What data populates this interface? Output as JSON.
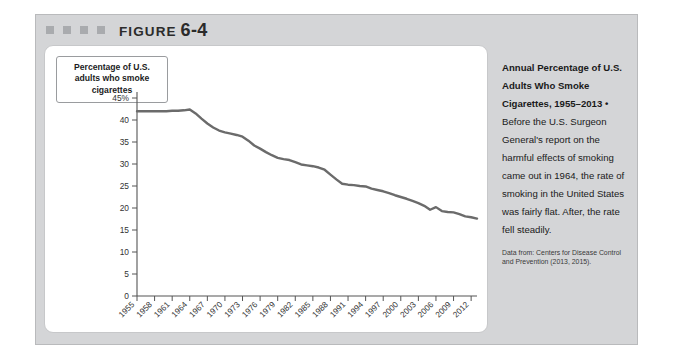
{
  "figure": {
    "label_word": "FIGURE",
    "label_number": "6-4",
    "decor_square_count": 4,
    "frame_color": "#d4d5d7",
    "panel_color": "#ffffff"
  },
  "axis_title_box": {
    "text": "Percentage of U.S. adults who smoke cigarettes"
  },
  "caption": {
    "lead": "Annual Percentage of U.S. Adults Who Smoke Cigarettes, 1955–2013 •",
    "body": "Before the U.S. Surgeon General's report on the harmful effects of smoking came out in 1964, the rate of smoking in the United States was fairly flat. After, the rate fell steadily.",
    "source": "Data from: Centers for Disease Control and Prevention (2013, 2015)."
  },
  "chart_data": {
    "type": "line",
    "title": "",
    "xlabel": "",
    "ylabel": "Percentage of U.S. adults who smoke cigarettes",
    "line_color": "#6b6b6b",
    "axis_color": "#555555",
    "grid": false,
    "legend": "none",
    "ylim": [
      0,
      45
    ],
    "yticks": [
      0,
      5,
      10,
      15,
      20,
      25,
      30,
      35,
      40,
      45
    ],
    "ytick_labels": [
      "0",
      "5",
      "10",
      "15",
      "20",
      "25",
      "30",
      "35",
      "40",
      "45%"
    ],
    "xlim": [
      1955,
      2013
    ],
    "xticks": [
      1955,
      1958,
      1961,
      1964,
      1967,
      1970,
      1973,
      1976,
      1979,
      1982,
      1985,
      1988,
      1991,
      1994,
      1997,
      2000,
      2003,
      2006,
      2009,
      2012
    ],
    "xtick_labels": [
      "1955",
      "1958",
      "1961",
      "1964",
      "1967",
      "1970",
      "1973",
      "1976",
      "1979",
      "1982",
      "1985",
      "1988",
      "1991",
      "1994",
      "1997",
      "2000",
      "2003",
      "2006",
      "2009",
      "2012"
    ],
    "series": [
      {
        "name": "Percentage of U.S. adults who smoke cigarettes",
        "x": [
          1955,
          1956,
          1957,
          1958,
          1959,
          1960,
          1961,
          1962,
          1963,
          1964,
          1965,
          1966,
          1967,
          1968,
          1969,
          1970,
          1971,
          1972,
          1973,
          1974,
          1975,
          1976,
          1977,
          1978,
          1979,
          1980,
          1981,
          1982,
          1983,
          1984,
          1985,
          1986,
          1987,
          1988,
          1989,
          1990,
          1991,
          1992,
          1993,
          1994,
          1995,
          1996,
          1997,
          1998,
          1999,
          2000,
          2001,
          2002,
          2003,
          2004,
          2005,
          2006,
          2007,
          2008,
          2009,
          2010,
          2011,
          2012,
          2013
        ],
        "values": [
          42.0,
          42.0,
          42.0,
          42.0,
          42.0,
          42.0,
          42.1,
          42.1,
          42.2,
          42.4,
          41.5,
          40.3,
          39.2,
          38.3,
          37.6,
          37.2,
          36.9,
          36.6,
          36.2,
          35.3,
          34.2,
          33.5,
          32.7,
          32.0,
          31.4,
          31.1,
          30.9,
          30.4,
          29.9,
          29.7,
          29.5,
          29.2,
          28.7,
          27.6,
          26.5,
          25.5,
          25.3,
          25.2,
          25.0,
          24.9,
          24.4,
          24.1,
          23.8,
          23.4,
          22.9,
          22.5,
          22.1,
          21.6,
          21.1,
          20.5,
          19.6,
          20.2,
          19.3,
          19.1,
          19.0,
          18.6,
          18.1,
          17.9,
          17.6
        ]
      }
    ]
  }
}
